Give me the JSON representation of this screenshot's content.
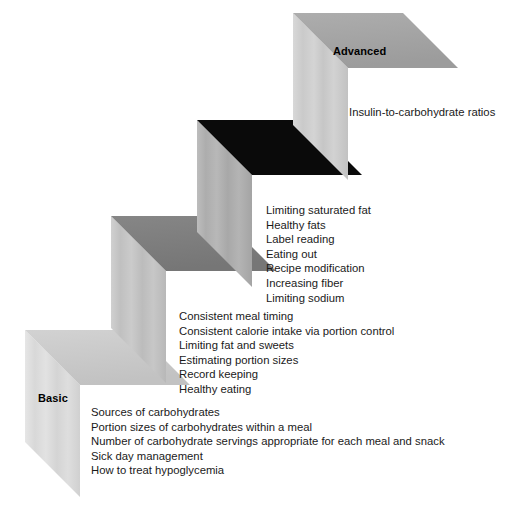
{
  "diagram": {
    "type": "staircase-progression",
    "axis_labels": {
      "top": "Advanced",
      "bottom": "Basic"
    },
    "colors": {
      "step_top_1": "#a6a6a6",
      "step_top_2": "#0a0a0a",
      "step_top_3": "#7d7d7d",
      "step_top_4": "#c9c9c9",
      "riser_1": "#cfcfcf",
      "riser_2": "#b0b0b0",
      "riser_3": "#c4c4c4",
      "riser_4": "#dcdcdc",
      "text": "#1a1a1a",
      "background": "#ffffff"
    },
    "steps": [
      {
        "id": "advanced",
        "level": 4,
        "label": "Advanced",
        "label_visible": true,
        "top_face_color": "#a6a6a6",
        "riser_color": "#cfcfcf",
        "topics": [
          "Insulin-to-carbohydrate ratios"
        ]
      },
      {
        "id": "intermediate-advanced",
        "level": 3,
        "label": "",
        "label_visible": false,
        "top_face_color": "#0a0a0a",
        "riser_color": "#b0b0b0",
        "topics": [
          "Limiting saturated fat",
          "Healthy fats",
          "Label reading",
          "Eating out",
          "Recipe modification",
          "Increasing fiber",
          "Limiting sodium"
        ]
      },
      {
        "id": "intermediate",
        "level": 2,
        "label": "",
        "label_visible": false,
        "top_face_color": "#7d7d7d",
        "riser_color": "#c4c4c4",
        "topics": [
          "Consistent meal timing",
          "Consistent calorie intake via portion control",
          "Limiting fat and sweets",
          "Estimating portion sizes",
          "Record keeping",
          "Healthy eating"
        ]
      },
      {
        "id": "basic",
        "level": 1,
        "label": "Basic",
        "label_visible": true,
        "top_face_color": "#c9c9c9",
        "riser_color": "#dcdcdc",
        "topics": [
          "Sources of carbohydrates",
          "Portion sizes of carbohydrates within a meal",
          "Number of carbohydrate servings appropriate for each meal and snack",
          "Sick day management",
          "How to treat hypoglycemia"
        ]
      }
    ]
  }
}
